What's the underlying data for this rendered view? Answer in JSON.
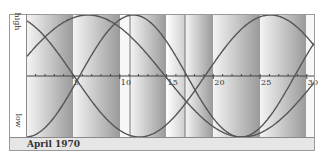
{
  "chart_data": {
    "type": "line",
    "title": "April 1970",
    "xlabel": "",
    "ylabel_top": "high",
    "ylabel_bottom": "low",
    "x_ticks": [
      5,
      10,
      15,
      20,
      25,
      30
    ],
    "x_range": [
      0,
      31
    ],
    "y_range": [
      -1,
      1
    ],
    "grid": false,
    "legend": null,
    "series": [
      {
        "name": "curve-23-day",
        "period": 23,
        "phase_zero_rising_day": 5.7,
        "kind": "sin"
      },
      {
        "name": "curve-28-day",
        "period": 28,
        "phase_zero_falling_day": 5.1,
        "kind": "neg-sin"
      },
      {
        "name": "curve-33-day",
        "period": 33,
        "phase_peak_day": 6.6,
        "kind": "cos"
      }
    ],
    "bands": [
      {
        "x0": 27,
        "x1": 73,
        "style": "light-to-dark"
      },
      {
        "x0": 73,
        "x1": 120,
        "style": "light-to-dark"
      },
      {
        "x0": 120,
        "x1": 130,
        "style": "white"
      },
      {
        "x0": 130,
        "x1": 166,
        "style": "light-to-dark"
      },
      {
        "x0": 166,
        "x1": 185,
        "style": "white-to-light"
      },
      {
        "x0": 185,
        "x1": 213,
        "style": "light-to-dark"
      },
      {
        "x0": 213,
        "x1": 260,
        "style": "light-to-dark"
      },
      {
        "x0": 260,
        "x1": 306,
        "style": "light-to-dark"
      },
      {
        "x0": 306,
        "x1": 314,
        "style": "white"
      }
    ],
    "vertical_lines": [
      130,
      185
    ]
  },
  "labels": {
    "high": "high",
    "low": "low",
    "footer": "April 1970"
  },
  "colors": {
    "curve": "#555555",
    "axis": "#444444",
    "band_dark": "#9a9a9a",
    "band_light": "#f4f4f4"
  }
}
